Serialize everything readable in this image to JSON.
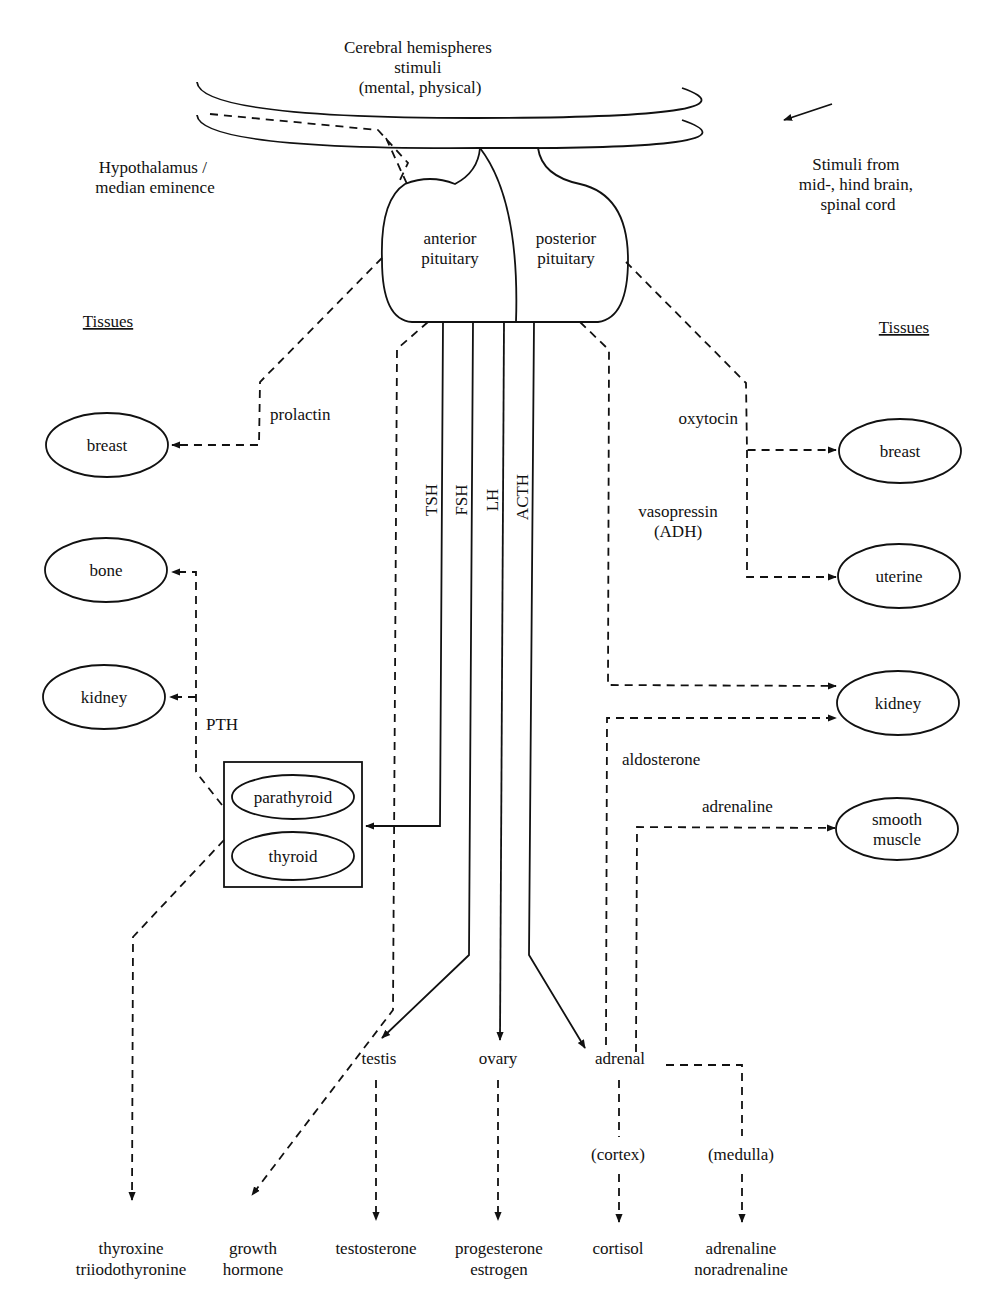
{
  "top": {
    "cerebral": [
      "Cerebral hemispheres",
      "stimuli",
      "(mental, physical)"
    ],
    "hypothalamus": [
      "Hypothalamus /",
      "median eminence"
    ],
    "stimuli_from": [
      "Stimuli from",
      "mid-, hind brain,",
      "spinal cord"
    ]
  },
  "pituitary": {
    "anterior": [
      "anterior",
      "pituitary"
    ],
    "posterior": [
      "posterior",
      "pituitary"
    ]
  },
  "tissues_heading_left": "Tissues",
  "tissues_heading_right": "Tissues",
  "left_tissues": {
    "breast": "breast",
    "bone": "bone",
    "kidney": "kidney"
  },
  "right_tissues": {
    "breast": "breast",
    "uterine": "uterine",
    "kidney": "kidney",
    "smooth_muscle": [
      "smooth",
      "muscle"
    ]
  },
  "hormones": {
    "prolactin": "prolactin",
    "pth": "PTH",
    "tsh": "TSH",
    "fsh": "FSH",
    "lh": "LH",
    "acth": "ACTH",
    "oxytocin": "oxytocin",
    "vasopressin": [
      "vasopressin",
      "(ADH)"
    ],
    "aldosterone": "aldosterone",
    "adrenaline": "adrenaline"
  },
  "glands": {
    "parathyroid": "parathyroid",
    "thyroid": "thyroid",
    "testis": "testis",
    "ovary": "ovary",
    "adrenal": "adrenal",
    "cortex": "(cortex)",
    "medulla": "(medulla)"
  },
  "outputs": {
    "thyroxine": [
      "thyroxine",
      "triiodothyronine"
    ],
    "growth_hormone": [
      "growth",
      "hormone"
    ],
    "testosterone": "testosterone",
    "progesterone": [
      "progesterone",
      "estrogen"
    ],
    "cortisol": "cortisol",
    "adrenaline": [
      "adrenaline",
      "noradrenaline"
    ]
  }
}
